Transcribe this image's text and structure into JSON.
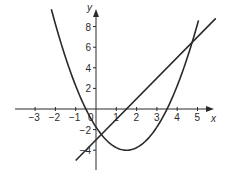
{
  "chart_data": {
    "type": "line",
    "title": "",
    "xlabel": "x",
    "ylabel": "y",
    "xlim": [
      -4,
      5.8
    ],
    "ylim": [
      -5.5,
      9.5
    ],
    "grid": false,
    "legend": null,
    "x_ticks": [
      -3,
      -2,
      -1,
      0,
      1,
      2,
      3,
      4,
      5
    ],
    "x_tick_labels": [
      "−3",
      "−2",
      "−1",
      "0",
      "1",
      "2",
      "3",
      "4",
      "5"
    ],
    "y_ticks": [
      8,
      6,
      4,
      2,
      -2,
      -4
    ],
    "y_tick_labels": [
      "8",
      "6",
      "4",
      "2",
      "−2",
      "−4"
    ],
    "series": [
      {
        "name": "parabola",
        "equation": "y = x^2 - 3x - 1.75",
        "x_range": [
          -2.2,
          5.05
        ],
        "points": [
          [
            -2.2,
            9.69
          ],
          [
            -2,
            8.25
          ],
          [
            -1,
            2.25
          ],
          [
            -0.5,
            0
          ],
          [
            0,
            -1.75
          ],
          [
            1,
            -3.75
          ],
          [
            1.5,
            -4
          ],
          [
            2,
            -3.75
          ],
          [
            3,
            -1.75
          ],
          [
            3.5,
            0
          ],
          [
            4,
            2.25
          ],
          [
            5,
            8.25
          ],
          [
            5.05,
            8.6
          ]
        ],
        "vertex": [
          1.5,
          -4
        ],
        "roots": [
          -0.5,
          3.5
        ]
      },
      {
        "name": "line",
        "equation": "y = 2x - 3",
        "x_range": [
          -1,
          5.9
        ],
        "points": [
          [
            -1,
            -5
          ],
          [
            0,
            -3
          ],
          [
            1.5,
            0
          ],
          [
            5.9,
            8.8
          ]
        ]
      }
    ],
    "intersections": [
      [
        0.26,
        -2.48
      ],
      [
        4.74,
        6.48
      ]
    ]
  },
  "axes": {
    "x_label": "x",
    "y_label": "y"
  }
}
